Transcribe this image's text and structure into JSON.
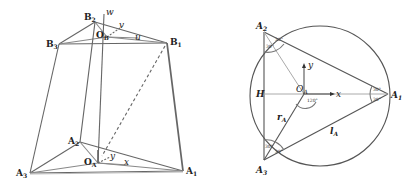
{
  "left_diagram": {
    "title": "parallel mechanism 3D view",
    "labels": {
      "B1": {
        "main": "B",
        "sub": "1"
      },
      "B2": {
        "main": "B",
        "sub": "2"
      },
      "B3": {
        "main": "B",
        "sub": "3"
      },
      "OB": {
        "main": "O",
        "sub": "B"
      },
      "A1": {
        "main": "A",
        "sub": "1"
      },
      "A2": {
        "main": "A",
        "sub": "2"
      },
      "A3": {
        "main": "A",
        "sub": "3"
      },
      "OA": {
        "main": "O",
        "sub": "A"
      },
      "u": "u",
      "v": "v",
      "w": "w",
      "x": "x",
      "y": "y",
      "z": "z"
    }
  },
  "right_diagram": {
    "title": "base triangle geometry",
    "labels": {
      "A1": {
        "main": "A",
        "sub": "1"
      },
      "A2": {
        "main": "A",
        "sub": "2"
      },
      "A3": {
        "main": "A",
        "sub": "3"
      },
      "OA": {
        "main": "O",
        "sub": "A"
      },
      "H": "H",
      "x": "x",
      "y": "y",
      "rA": {
        "main": "r",
        "sub": "A"
      },
      "lA": {
        "main": "l",
        "sub": "A"
      }
    },
    "angles": {
      "a2_left": "30°",
      "a2_right": "30°",
      "a1_top": "30°",
      "a1_bottom": "30°",
      "a3_left": "30°",
      "a3_right": "30°",
      "center": "120°"
    }
  },
  "colors": {
    "line": "#555555",
    "light_line": "#aaaaaa",
    "text": "#222222"
  }
}
